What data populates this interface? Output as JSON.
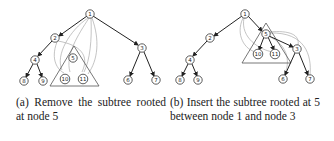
{
  "panel_a": {
    "caption": "(a) Remove the subtree rooted at node 5",
    "nodes": [
      {
        "id": "1",
        "x": 90,
        "y": 14
      },
      {
        "id": "2",
        "x": 55,
        "y": 38
      },
      {
        "id": "3",
        "x": 142,
        "y": 48
      },
      {
        "id": "4",
        "x": 35,
        "y": 60
      },
      {
        "id": "5",
        "x": 73,
        "y": 58
      },
      {
        "id": "6",
        "x": 128,
        "y": 80
      },
      {
        "id": "7",
        "x": 156,
        "y": 80
      },
      {
        "id": "8",
        "x": 24,
        "y": 81
      },
      {
        "id": "9",
        "x": 43,
        "y": 81
      },
      {
        "id": "10",
        "x": 65,
        "y": 79
      },
      {
        "id": "11",
        "x": 83,
        "y": 79
      }
    ]
  },
  "panel_b": {
    "caption": "(b) Insert the subtree rooted at 5 between node 1 and node 3",
    "nodes": [
      {
        "id": "1",
        "x": 245,
        "y": 14
      },
      {
        "id": "2",
        "x": 210,
        "y": 38
      },
      {
        "id": "3",
        "x": 297,
        "y": 49
      },
      {
        "id": "4",
        "x": 190,
        "y": 60
      },
      {
        "id": "5",
        "x": 266,
        "y": 34
      },
      {
        "id": "6",
        "x": 283,
        "y": 79
      },
      {
        "id": "7",
        "x": 310,
        "y": 79
      },
      {
        "id": "8",
        "x": 180,
        "y": 80
      },
      {
        "id": "9",
        "x": 198,
        "y": 80
      },
      {
        "id": "10",
        "x": 258,
        "y": 54
      },
      {
        "id": "11",
        "x": 275,
        "y": 54
      }
    ]
  }
}
